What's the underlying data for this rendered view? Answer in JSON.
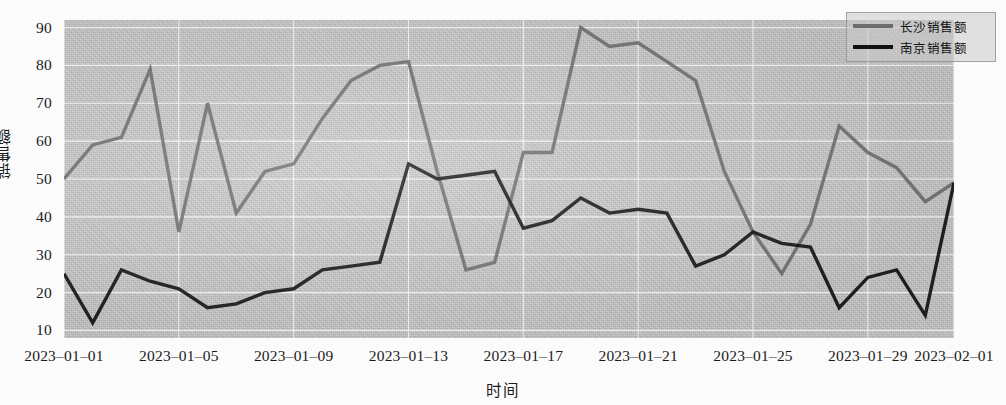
{
  "chart_data": {
    "type": "line",
    "title": "",
    "xlabel": "时间",
    "ylabel": "销售额",
    "ylim": [
      8,
      92
    ],
    "yticks": [
      10,
      20,
      30,
      40,
      50,
      60,
      70,
      80,
      90
    ],
    "grid": true,
    "legend_position": "top-right",
    "x": [
      "2023-01-01",
      "2023-01-02",
      "2023-01-03",
      "2023-01-04",
      "2023-01-05",
      "2023-01-06",
      "2023-01-07",
      "2023-01-08",
      "2023-01-09",
      "2023-01-10",
      "2023-01-11",
      "2023-01-12",
      "2023-01-13",
      "2023-01-14",
      "2023-01-15",
      "2023-01-16",
      "2023-01-17",
      "2023-01-18",
      "2023-01-19",
      "2023-01-20",
      "2023-01-21",
      "2023-01-22",
      "2023-01-23",
      "2023-01-24",
      "2023-01-25",
      "2023-01-26",
      "2023-01-27",
      "2023-01-28",
      "2023-01-29",
      "2023-01-30",
      "2023-01-31",
      "2023-02-01"
    ],
    "xticks": [
      "2023-01-01",
      "2023-01-05",
      "2023-01-09",
      "2023-01-13",
      "2023-01-17",
      "2023-01-21",
      "2023-01-25",
      "2023-01-29",
      "2023-02-01"
    ],
    "series": [
      {
        "name": "长沙销售额",
        "color": "#6d6d6d",
        "values": [
          50,
          59,
          61,
          79,
          36,
          70,
          41,
          52,
          54,
          66,
          76,
          80,
          81,
          52,
          26,
          28,
          57,
          57,
          90,
          85,
          86,
          81,
          76,
          52,
          36,
          25,
          38,
          64,
          57,
          53,
          44,
          49
        ]
      },
      {
        "name": "南京销售额",
        "color": "#111111",
        "values": [
          25,
          12,
          26,
          23,
          21,
          16,
          17,
          20,
          21,
          26,
          27,
          28,
          54,
          50,
          51,
          52,
          37,
          39,
          45,
          41,
          42,
          41,
          27,
          30,
          36,
          33,
          32,
          16,
          24,
          26,
          14,
          49
        ]
      }
    ]
  }
}
